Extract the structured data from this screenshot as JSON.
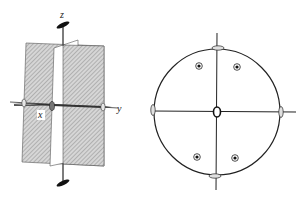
{
  "figure": {
    "left_panel": {
      "description": "3D sketch of symmetry elements with two perpendicular mirror planes",
      "axes": {
        "x_label": "x",
        "y_label": "y",
        "z_label": "z"
      },
      "elements": [
        "mirror-plane-xz",
        "mirror-plane-yz",
        "twofold-axis-z",
        "twofold-axis-y",
        "twofold-axis-x"
      ]
    },
    "right_panel": {
      "description": "Stereographic projection",
      "poles_count": 4,
      "twofold_symbols_on_circle": 4,
      "center_symbol": "twofold-axis-center"
    },
    "colors": {
      "line": "#222222",
      "plane_fill": "#c8c8c8",
      "hatch": "#8a8a8a",
      "background": "#ffffff"
    }
  }
}
